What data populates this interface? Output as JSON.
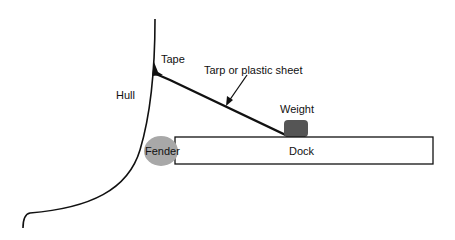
{
  "diagram": {
    "labels": {
      "hull": "Hull",
      "tape": "Tape",
      "tarp": "Tarp or plastic sheet",
      "weight": "Weight",
      "fender": "Fender",
      "dock": "Dock"
    },
    "colors": {
      "line": "#111111",
      "weight_fill": "#555555",
      "fender_fill": "#a8a8a8",
      "dock_fill": "#ffffff"
    }
  }
}
